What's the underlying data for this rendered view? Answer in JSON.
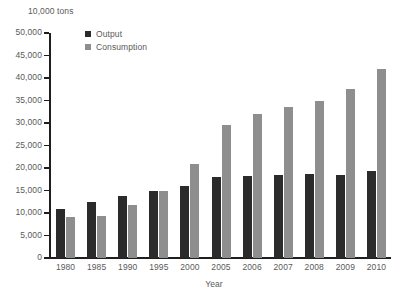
{
  "chart_data": {
    "type": "bar",
    "title": "",
    "subtitle": "",
    "unit_label": "10,000 tons",
    "xlabel": "Year",
    "ylabel": "",
    "ylim": [
      0,
      50000
    ],
    "ytick_step": 5000,
    "grid": false,
    "legend_position": "top-left",
    "categories": [
      "1980",
      "1985",
      "1990",
      "1995",
      "2000",
      "2005",
      "2006",
      "2007",
      "2008",
      "2009",
      "2010"
    ],
    "ytick_labels": [
      "50,000",
      "45,000",
      "40,000",
      "35,000",
      "30,000",
      "25,000",
      "20,000",
      "15,000",
      "10,000",
      "5,000",
      "0"
    ],
    "ytick_values": [
      50000,
      45000,
      40000,
      35000,
      30000,
      25000,
      20000,
      15000,
      10000,
      5000,
      0
    ],
    "series": [
      {
        "name": "Output",
        "color": "#2b2b2b",
        "values": [
          10800,
          12400,
          13800,
          15000,
          16100,
          18000,
          18300,
          18400,
          18600,
          18400,
          19400
        ]
      },
      {
        "name": "Consumption",
        "color": "#8e8e8e",
        "values": [
          9200,
          9400,
          11700,
          14800,
          20800,
          29600,
          31900,
          33600,
          34900,
          37600,
          42000
        ]
      }
    ]
  },
  "legend": {
    "items": [
      {
        "label": "Output",
        "color": "#2b2b2b"
      },
      {
        "label": "Consumption",
        "color": "#8e8e8e"
      }
    ]
  },
  "axis": {
    "unit_label": "10,000 tons",
    "x_title": "Year"
  }
}
